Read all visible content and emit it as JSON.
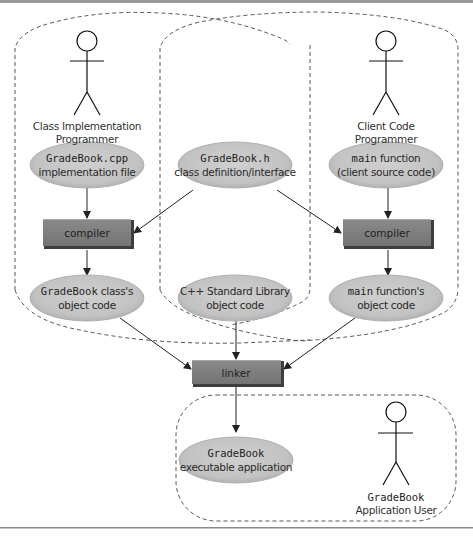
{
  "diagram": {
    "type": "compilation-and-linking-process",
    "actors": {
      "class_impl": {
        "line1": "Class Implementation",
        "line2": "Programmer"
      },
      "client": {
        "line1": "Client Code",
        "line2": "Programmer"
      },
      "app_user": {
        "line1": "GradeBook",
        "line2": "Application User"
      }
    },
    "nodes": {
      "impl_file": {
        "code": "GradeBook.cpp",
        "text": "implementation file"
      },
      "header": {
        "code": "GradeBook.h",
        "text": "class definition/interface"
      },
      "main_src": {
        "code": "main",
        "text_inline": " function",
        "text": "(client source code)"
      },
      "compiler_left": {
        "label": "compiler"
      },
      "compiler_right": {
        "label": "compiler"
      },
      "class_obj": {
        "code": "GradeBook",
        "text_inline": " class's",
        "text": "object code"
      },
      "stdlib_obj": {
        "line1": "C++ Standard Library",
        "text": "object code"
      },
      "main_obj": {
        "code": "main",
        "text_inline": " function's",
        "text": "object code"
      },
      "linker": {
        "label": "linker"
      },
      "executable": {
        "code": "GradeBook",
        "text": "executable application"
      }
    },
    "edges": [
      {
        "from": "GradeBook.cpp",
        "to": "compiler (left)"
      },
      {
        "from": "GradeBook.h",
        "to": "compiler (left)"
      },
      {
        "from": "GradeBook.h",
        "to": "compiler (right)"
      },
      {
        "from": "main function",
        "to": "compiler (right)"
      },
      {
        "from": "compiler (left)",
        "to": "GradeBook class's object code"
      },
      {
        "from": "compiler (right)",
        "to": "main function's object code"
      },
      {
        "from": "GradeBook class's object code",
        "to": "linker"
      },
      {
        "from": "C++ Standard Library object code",
        "to": "linker"
      },
      {
        "from": "main function's object code",
        "to": "linker"
      },
      {
        "from": "linker",
        "to": "GradeBook executable application"
      }
    ],
    "colors": {
      "ellipse_fill": "#c4c4c4",
      "ellipse_edge": "#a8a8a8",
      "box_fill": "#7a7a7a",
      "box_top": "#9a9a9a",
      "box_shadow": "#3e3e3e",
      "dashed": "#555555",
      "rule": "#8a8a8a"
    }
  }
}
